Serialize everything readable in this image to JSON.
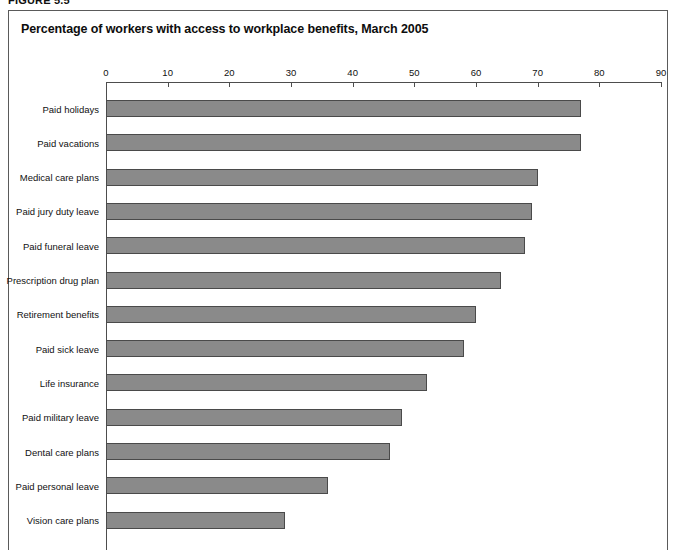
{
  "figure": {
    "caption": "FIGURE 5.5"
  },
  "chart_data": {
    "type": "bar",
    "orientation": "horizontal",
    "title": "Percentage of workers with access to workplace benefits, March 2005",
    "xlabel": "",
    "ylabel": "",
    "xlim": [
      0,
      90
    ],
    "xticks": [
      0,
      10,
      20,
      30,
      40,
      50,
      60,
      70,
      80,
      90
    ],
    "tick_labels": [
      "0",
      "10",
      "20",
      "30",
      "40",
      "50",
      "60",
      "70",
      "80",
      "90"
    ],
    "grid": false,
    "legend": null,
    "bar_color": "#8a8a8a",
    "bar_border_color": "#4a4a4a",
    "categories": [
      "Paid holidays",
      "Paid vacations",
      "Medical care plans",
      "Paid jury duty leave",
      "Paid funeral leave",
      "Prescription drug plan",
      "Retirement benefits",
      "Paid sick leave",
      "Life insurance",
      "Paid military leave",
      "Dental care plans",
      "Paid personal leave",
      "Vision care plans"
    ],
    "values": [
      77,
      77,
      70,
      69,
      68,
      64,
      60,
      58,
      52,
      48,
      46,
      36,
      29
    ]
  }
}
